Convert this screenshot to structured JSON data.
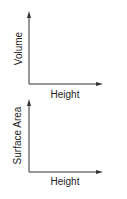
{
  "diagrams": [
    {
      "ylabel": "Volume",
      "xlabel": "Height"
    },
    {
      "ylabel": "Surface Area",
      "xlabel": "Height"
    }
  ],
  "colors": {
    "axis": "#333333",
    "text": "#222222",
    "background": "#ffffff"
  }
}
